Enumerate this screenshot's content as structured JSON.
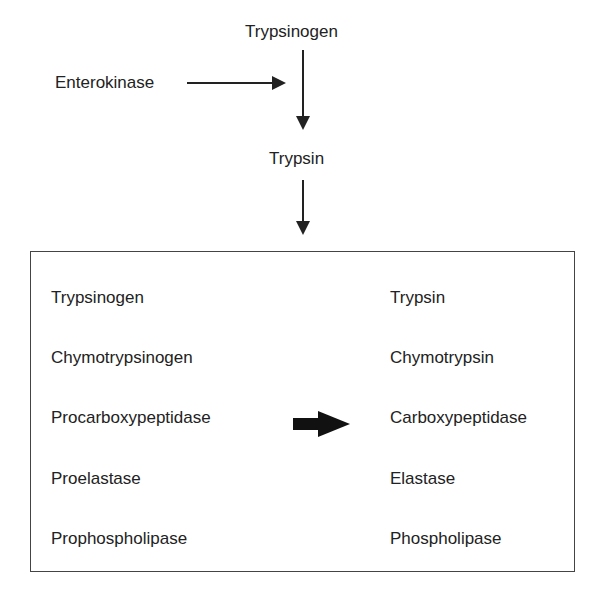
{
  "diagram": {
    "top_node": "Trypsinogen",
    "activator": "Enterokinase",
    "middle_node": "Trypsin",
    "box": {
      "precursors": [
        "Trypsinogen",
        "Chymotrypsinogen",
        "Procarboxypeptidase",
        "Proelastase",
        "Prophospholipase"
      ],
      "active_enzymes": [
        "Trypsin",
        "Chymotrypsin",
        "Carboxypeptidase",
        "Elastase",
        "Phospholipase"
      ]
    }
  }
}
